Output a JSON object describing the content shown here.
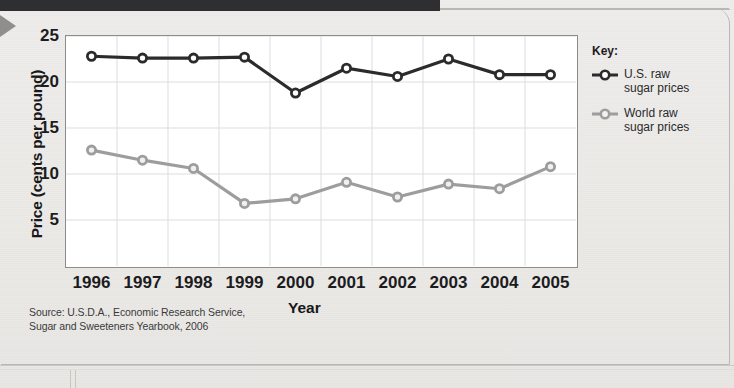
{
  "chart_data": {
    "type": "line",
    "title": "",
    "xlabel": "Year",
    "ylabel": "Price (cents per pound)",
    "categories": [
      "1996",
      "1997",
      "1998",
      "1999",
      "2000",
      "2001",
      "2002",
      "2003",
      "2004",
      "2005"
    ],
    "x": [
      1996,
      1997,
      1998,
      1999,
      2000,
      2001,
      2002,
      2003,
      2004,
      2005
    ],
    "xlim": [
      1996,
      2005
    ],
    "ylim": [
      0,
      25
    ],
    "yticks": [
      5,
      10,
      15,
      20,
      25
    ],
    "grid": true,
    "legend_position": "right",
    "series": [
      {
        "name": "U.S. raw sugar prices",
        "color": "#2b2b2d",
        "values": [
          22.8,
          22.6,
          22.6,
          22.7,
          18.8,
          21.5,
          20.6,
          22.5,
          20.8,
          20.8
        ]
      },
      {
        "name": "World raw sugar prices",
        "color": "#9d9d9d",
        "values": [
          12.6,
          11.5,
          10.6,
          6.8,
          7.3,
          9.1,
          7.5,
          8.9,
          8.4,
          10.8
        ]
      }
    ]
  },
  "axes": {
    "y_title": "Price (cents per pound)",
    "x_title": "Year"
  },
  "legend": {
    "title": "Key:",
    "items": [
      {
        "label": "U.S. raw\nsugar prices",
        "color": "#2b2b2d",
        "marker": "circle-dark"
      },
      {
        "label": "World raw\nsugar prices",
        "color": "#9d9d9d",
        "marker": "circle-light"
      }
    ]
  },
  "source": {
    "line1": "Source: U.S.D.A., Economic Research Service,",
    "line2": "Sugar and Sweeteners Yearbook, 2006"
  }
}
